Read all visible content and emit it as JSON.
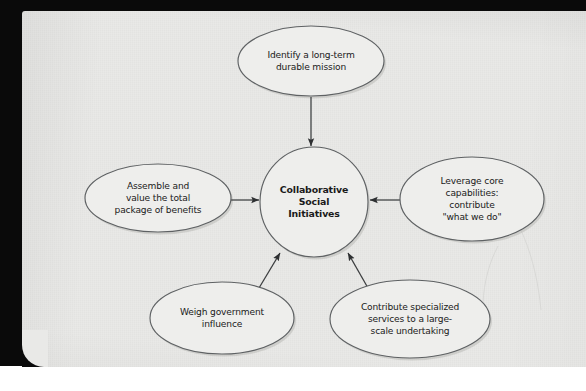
{
  "page": {
    "background_color": "#e9e9e7",
    "border_color": "#0a0a0a",
    "outer_background": "#ffffff"
  },
  "diagram": {
    "type": "hub-and-spoke concept map",
    "shape_fill": "#eeeeec",
    "shape_stroke": "#5e6163",
    "connector_color": "#3b3d3f",
    "center": {
      "id": "collaborative-social-initiatives",
      "lines": [
        "Collaborative",
        "Social",
        "Initiatives"
      ],
      "bold": true,
      "cx": 314,
      "cy": 202,
      "rx": 54,
      "ry": 55
    },
    "nodes": [
      {
        "id": "identify-mission",
        "position": "top",
        "lines": [
          "Identify a long-term",
          "durable mission"
        ],
        "cx": 311,
        "cy": 61,
        "rx": 73,
        "ry": 35,
        "arrow": "points down into center"
      },
      {
        "id": "assemble-value-benefits",
        "position": "left",
        "lines": [
          "Assemble and",
          "value the total",
          "package of benefits"
        ],
        "cx": 158,
        "cy": 198,
        "rx": 73,
        "ry": 34,
        "arrow": "points right into center"
      },
      {
        "id": "leverage-core-capabilities",
        "position": "right",
        "lines": [
          "Leverage core",
          "capabilities:",
          "contribute",
          "\"what we do\""
        ],
        "cx": 472,
        "cy": 199,
        "rx": 72,
        "ry": 42,
        "arrow": "points left into center"
      },
      {
        "id": "weigh-government-influence",
        "position": "bottom-left",
        "lines": [
          "Weigh government",
          "influence"
        ],
        "cx": 222,
        "cy": 318,
        "rx": 72,
        "ry": 36,
        "arrow": "points up-right into center"
      },
      {
        "id": "contribute-specialized-services",
        "position": "bottom-right",
        "lines": [
          "Contribute specialized",
          "services to a large-",
          "scale undertaking"
        ],
        "cx": 410,
        "cy": 319,
        "rx": 80,
        "ry": 39,
        "arrow": "points up-left into center"
      }
    ]
  }
}
